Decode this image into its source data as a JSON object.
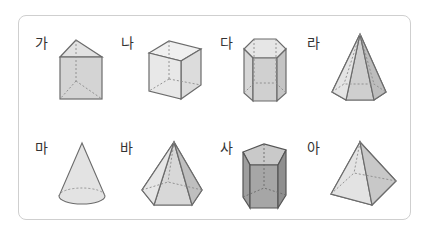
{
  "colors": {
    "frame_border": "#cfcfcf",
    "edge": "#6b6b6b",
    "hidden_edge": "#8a8a8a",
    "face_light": "#ececec",
    "face_mid": "#dedede",
    "face_dark": "#c9c9c9",
    "face_darkest": "#a9a9a9"
  },
  "figures": [
    {
      "label": "가",
      "shape": "triangular-prism"
    },
    {
      "label": "나",
      "shape": "cube"
    },
    {
      "label": "다",
      "shape": "hexagonal-prism"
    },
    {
      "label": "라",
      "shape": "hexagonal-pyramid"
    },
    {
      "label": "마",
      "shape": "cone"
    },
    {
      "label": "바",
      "shape": "pentagonal-pyramid"
    },
    {
      "label": "사",
      "shape": "pentagonal-prism"
    },
    {
      "label": "아",
      "shape": "square-pyramid"
    }
  ]
}
